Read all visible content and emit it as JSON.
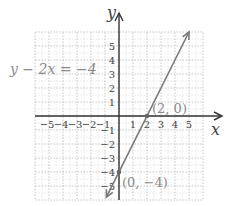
{
  "chart_data": {
    "type": "line",
    "title": "",
    "equation_label": "y − 2x = −4",
    "xlabel": "x",
    "ylabel": "y",
    "xlim": [
      -6,
      6
    ],
    "ylim": [
      -6,
      6
    ],
    "grid": true,
    "x_tick_labels": [
      "−5",
      "−4",
      "−3",
      "−2",
      "−1",
      "1",
      "2",
      "3",
      "4",
      "5"
    ],
    "x_ticks": [
      -5,
      -4,
      -3,
      -2,
      -1,
      1,
      2,
      3,
      4,
      5
    ],
    "y_tick_labels": [
      "5",
      "4",
      "3",
      "2",
      "1",
      "−1",
      "−2",
      "−3",
      "−4",
      "−5"
    ],
    "y_ticks": [
      5,
      4,
      3,
      2,
      1,
      -1,
      -2,
      -3,
      -4,
      -5
    ],
    "series": [
      {
        "name": "y − 2x = −4",
        "slope": 2,
        "intercept": -4,
        "x": [
          -0.9,
          5
        ],
        "y": [
          -5.8,
          6
        ],
        "arrows": "both"
      }
    ],
    "annotations": [
      {
        "label": "(2, 0)",
        "x": 2,
        "y": 0
      },
      {
        "label": "(0, −4)",
        "x": 0,
        "y": -4
      }
    ],
    "colors": {
      "axis": "#333333",
      "line": "#7a7a7a",
      "grid": "#b8b8b8",
      "label": "#8a8a8a",
      "tick": "#444444"
    }
  }
}
